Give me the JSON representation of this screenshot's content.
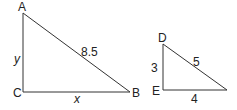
{
  "triangle_abc": {
    "vertices": {
      "A": "A",
      "B": "B",
      "C": "C"
    },
    "sides": {
      "AB": "8.5",
      "AC": "y",
      "CB": "x"
    }
  },
  "triangle_def": {
    "vertices": {
      "D": "D",
      "E": "E"
    },
    "sides": {
      "DF": "5",
      "DE": "3",
      "EF": "4"
    }
  },
  "colors": {
    "stroke": "#333333",
    "text": "#222222"
  }
}
